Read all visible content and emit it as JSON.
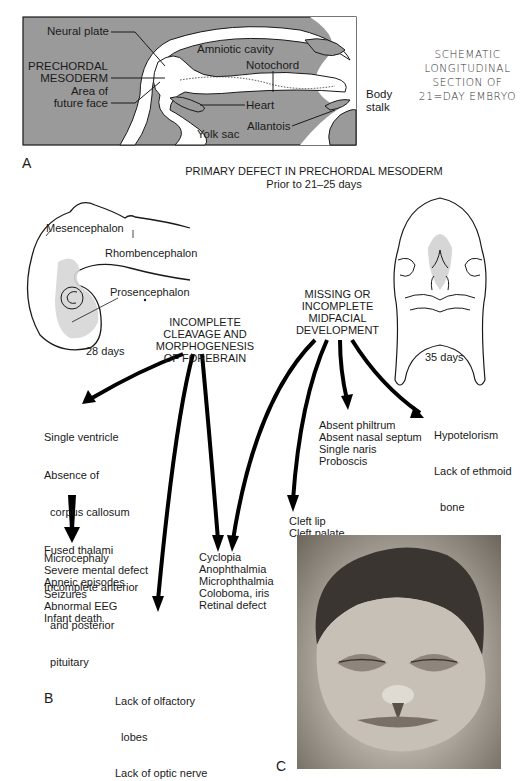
{
  "panel_a": {
    "letter": "A",
    "labels": {
      "neural_plate": "Neural plate",
      "prechordal_1": "PRECHORDAL",
      "prechordal_2": "MESODERM",
      "future_face_1": "Area of",
      "future_face_2": "future face",
      "amniotic_cavity": "Amniotic cavity",
      "notochord": "Notochord",
      "heart": "Heart",
      "yolk_sac": "Yolk sac",
      "allantois": "Allantois",
      "body_stalk_1": "Body",
      "body_stalk_2": "stalk"
    },
    "side_title": [
      "SCHEMATIC",
      "LONGITUDINAL",
      "SECTION OF",
      "21=DAY EMBRYO"
    ],
    "colors": {
      "tissue_gray": "#9a9a9a",
      "outline": "#1a1a1a"
    }
  },
  "header": {
    "title": "PRIMARY DEFECT IN PRECHORDAL MESODERM",
    "subtitle": "Prior to 21–25 days"
  },
  "panel_b": {
    "letter": "B",
    "embryo_28": {
      "mesencephalon": "Mesencephalon",
      "rhombencephalon": "Rhombencephalon",
      "prosencephalon": "Prosencephalon",
      "age": "28 days"
    },
    "face_35": {
      "age": "35 days"
    },
    "cause_forebrain": [
      "INCOMPLETE",
      "CLEAVAGE AND",
      "MORPHOGENESIS",
      "OF FOREBRAIN"
    ],
    "cause_midface": [
      "MISSING OR",
      "INCOMPLETE",
      "MIDFACIAL",
      "DEVELOPMENT"
    ],
    "effects": {
      "brain": [
        "Single ventricle",
        "Absence of",
        "  corpus callosum",
        "Fused thalami",
        "Incomplete anterior",
        "  and posterior",
        "  pituitary"
      ],
      "brain_sequelae": [
        "Microcephaly",
        "Severe mental defect",
        "Apneic episodes",
        "Seizures",
        "Abnormal EEG",
        "Infant death"
      ],
      "eyes": [
        "Cyclopia",
        "Anophthalmia",
        "Microphthalmia",
        "Coloboma, iris",
        "Retinal defect"
      ],
      "olfactory": [
        "Lack of olfactory",
        "  lobes",
        "Lack of optic nerve"
      ],
      "cleft": [
        "Cleft lip",
        "Cleft palate"
      ],
      "nose": [
        "Absent philtrum",
        "Absent nasal septum",
        "Single naris",
        "Proboscis"
      ],
      "orbit": [
        "Hypotelorism",
        "Lack of ethmoid",
        "  bone"
      ]
    }
  },
  "panel_c": {
    "letter": "C",
    "photo_description": "Infant face with holoprosencephaly features: closely set eyes, flat nose, midline cleft lip"
  }
}
